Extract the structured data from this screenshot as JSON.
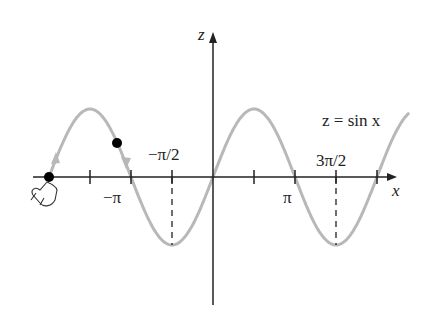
{
  "figure": {
    "curve_label": "z = sin x",
    "axis_labels": {
      "x": "x",
      "z": "z"
    },
    "tick_labels": {
      "neg_pi": "−π",
      "neg_half_pi": "−π/2",
      "pi": "π",
      "three_half_pi": "3π/2"
    },
    "colors": {
      "curve": "#b8b8b8",
      "axis": "#222222",
      "dot": "#000000"
    }
  }
}
